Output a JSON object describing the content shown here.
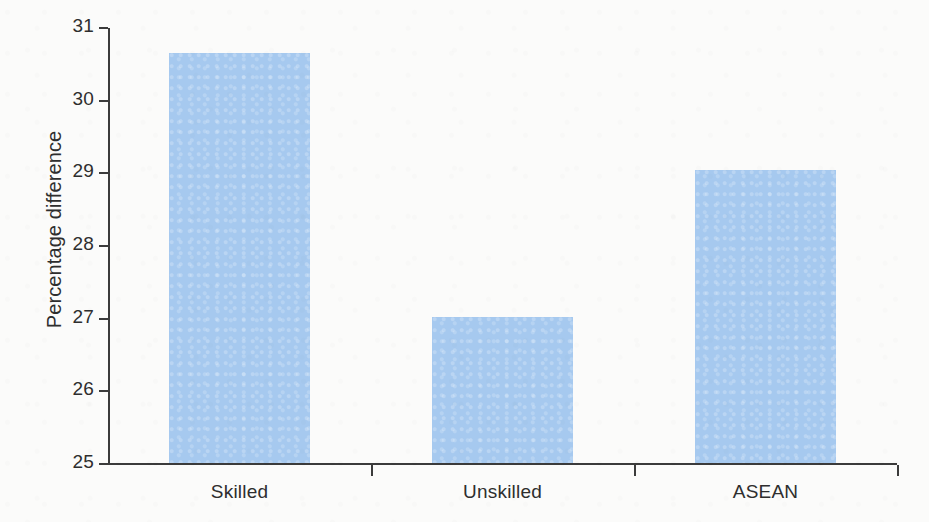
{
  "chart_data": {
    "type": "bar",
    "title": "",
    "xlabel": "",
    "ylabel": "Percentage difference",
    "categories": [
      "Skilled",
      "Unskilled",
      "ASEAN"
    ],
    "values": [
      30.65,
      27.02,
      29.05
    ],
    "ylim": [
      25,
      31
    ],
    "y_ticks": [
      25,
      26,
      27,
      28,
      29,
      30,
      31
    ],
    "y_tick_labels": [
      "25",
      "26",
      "27",
      "28",
      "29",
      "30",
      "31"
    ],
    "grid": false,
    "legend": null,
    "bar_color": "#a6c9ef",
    "axis_color": "#3b3b3b",
    "text_color": "#2e2e2e",
    "background_color": "#fbfbfa"
  },
  "axis": {
    "y_title": "Percentage difference"
  }
}
